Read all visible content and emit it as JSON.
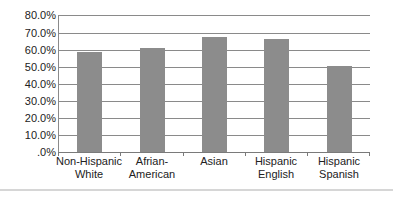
{
  "chart_data": {
    "type": "bar",
    "title": "",
    "xlabel": "",
    "ylabel": "",
    "categories": [
      "Non-Hispanic White",
      "Afrian-American",
      "Asian",
      "Hispanic English",
      "Hispanic Spanish"
    ],
    "category_lines": [
      [
        "Non-Hispanic",
        "White"
      ],
      [
        "Afrian-",
        "American"
      ],
      [
        "Asian",
        ""
      ],
      [
        "Hispanic",
        "English"
      ],
      [
        "Hispanic",
        "Spanish"
      ]
    ],
    "values": [
      58.5,
      61.0,
      67.0,
      66.0,
      50.0
    ],
    "ylim": [
      0,
      80
    ],
    "yticks": [
      ".0%",
      "10.0%",
      "20.0%",
      "30.0%",
      "40.0%",
      "50.0%",
      "60.0%",
      "70.0%",
      "80.0%"
    ],
    "grid": true,
    "legend": "none",
    "bar_color": "#8c8c8c"
  }
}
